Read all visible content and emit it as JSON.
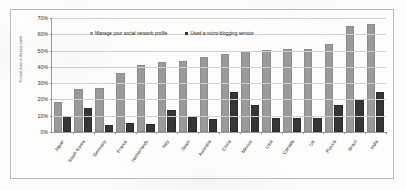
{
  "chart_data": {
    "type": "bar",
    "title": "",
    "subtitle": "",
    "xlabel": "",
    "ylabel": "% Have done in the last month",
    "ylim": [
      0,
      70
    ],
    "ytick_labels": [
      "70%",
      "60%",
      "50%",
      "40%",
      "30%",
      "20%",
      "10%",
      "0%"
    ],
    "ytick_values": [
      70,
      60,
      50,
      40,
      30,
      20,
      10,
      0
    ],
    "grid": true,
    "legend_position": "top-center",
    "categories": [
      "Japan",
      "South Korea",
      "Germany",
      "France",
      "Netherlands",
      "Italy",
      "Spain",
      "Australia",
      "China",
      "Mexico",
      "USA",
      "Canada",
      "UK",
      "Russia",
      "Brazil",
      "India"
    ],
    "series": [
      {
        "name": "Manage your social network profile",
        "color": "#9a9a9a",
        "values": [
          17,
          25,
          26,
          35,
          40,
          41.5,
          42.5,
          45,
          46.5,
          48.5,
          49,
          49.5,
          50,
          53,
          64,
          65
        ]
      },
      {
        "name": "Used a micro-blogging service",
        "color": "#363636",
        "values": [
          8.5,
          13.5,
          3,
          4.5,
          3.5,
          12,
          8,
          6.5,
          23.5,
          15.5,
          7.5,
          7.5,
          7.5,
          15.5,
          19,
          23.5
        ]
      }
    ]
  },
  "legend": {
    "items": [
      {
        "label": "Manage your social network profile"
      },
      {
        "label": "Used a micro-blogging service"
      }
    ]
  }
}
